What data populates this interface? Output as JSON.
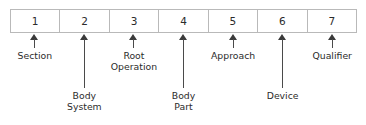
{
  "diagram": {
    "colors": {
      "box_border": "#b9b9b9",
      "box_fill": "#ffffff",
      "arrow": "#3a3a3a",
      "text": "#2b2b2b",
      "background": "#ffffff"
    },
    "code_box": {
      "characters": [
        {
          "position": "1",
          "label": "1"
        },
        {
          "position": "2",
          "label": "2"
        },
        {
          "position": "3",
          "label": "3"
        },
        {
          "position": "4",
          "label": "4"
        },
        {
          "position": "5",
          "label": "5"
        },
        {
          "position": "6",
          "label": "6"
        },
        {
          "position": "7",
          "label": "7"
        }
      ]
    },
    "callouts": [
      {
        "character": "1",
        "label": "Section",
        "row": "upper",
        "cell_index": 0,
        "arrow_top": 34,
        "arrow_height": 14,
        "caption_top": 50
      },
      {
        "character": "2",
        "label": "Body\nSystem",
        "row": "lower",
        "cell_index": 1,
        "arrow_top": 34,
        "arrow_height": 54,
        "caption_top": 90
      },
      {
        "character": "3",
        "label": "Root\nOperation",
        "row": "upper",
        "cell_index": 2,
        "arrow_top": 34,
        "arrow_height": 14,
        "caption_top": 50
      },
      {
        "character": "4",
        "label": "Body\nPart",
        "row": "lower",
        "cell_index": 3,
        "arrow_top": 34,
        "arrow_height": 54,
        "caption_top": 90
      },
      {
        "character": "5",
        "label": "Approach",
        "row": "upper",
        "cell_index": 4,
        "arrow_top": 34,
        "arrow_height": 14,
        "caption_top": 50
      },
      {
        "character": "6",
        "label": "Device",
        "row": "lower",
        "cell_index": 5,
        "arrow_top": 34,
        "arrow_height": 54,
        "caption_top": 90
      },
      {
        "character": "7",
        "label": "Qualifier",
        "row": "upper",
        "cell_index": 6,
        "arrow_top": 34,
        "arrow_height": 14,
        "caption_top": 50
      }
    ]
  }
}
